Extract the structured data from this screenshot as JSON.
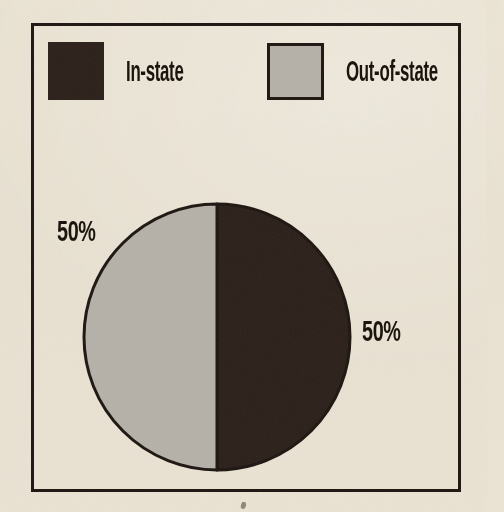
{
  "page": {
    "background_color": "#e9e2d2",
    "frame_border_color": "#1d1510",
    "text_color": "#171009"
  },
  "chart_data": {
    "type": "pie",
    "title": "",
    "legend_position": "top",
    "start_angle_deg": 0,
    "clockwise": true,
    "outline_color": "#1d1510",
    "slices": [
      {
        "label": "In-state",
        "value": 50,
        "display_label": "50%",
        "color": "#2b2019",
        "callout_side": "right"
      },
      {
        "label": "Out-of-state",
        "value": 50,
        "display_label": "50%",
        "color": "#b5b1a8",
        "callout_side": "left"
      }
    ]
  }
}
